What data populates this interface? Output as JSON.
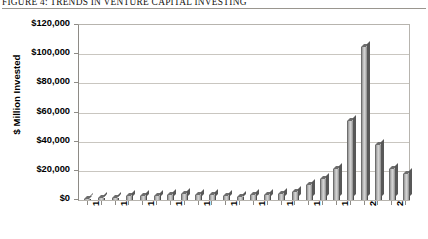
{
  "figure": {
    "title": "FIGURE 4: TRENDS IN VENTURE CAPITAL INVESTING"
  },
  "chart_data": {
    "type": "bar",
    "title": "FIGURE 4: TRENDS IN VENTURE CAPITAL INVESTING",
    "xlabel": "",
    "ylabel": "$ Million Invested",
    "ylim": [
      0,
      120000
    ],
    "ytick_labels": [
      "$120,000",
      "$100,000",
      "$80,000",
      "$60,000",
      "$40,000",
      "$20,000",
      "$0"
    ],
    "ytick_values": [
      120000,
      100000,
      80000,
      60000,
      40000,
      20000,
      0
    ],
    "grid": true,
    "legend": false,
    "xtick_labels": [
      "1980",
      "1982",
      "1984",
      "1986",
      "1988",
      "1990",
      "1992",
      "1994",
      "1996",
      "1998",
      "2000",
      "2002"
    ],
    "xtick_label_rotation": 90,
    "categories": [
      "1980",
      "1981",
      "1982",
      "1983",
      "1984",
      "1985",
      "1986",
      "1987",
      "1988",
      "1989",
      "1990",
      "1991",
      "1992",
      "1993",
      "1994",
      "1995",
      "1996",
      "1997",
      "1998",
      "1999",
      "2000",
      "2001",
      "2002",
      "2003"
    ],
    "values": [
      600,
      1100,
      1400,
      2800,
      2900,
      2700,
      3200,
      3800,
      3400,
      3300,
      2800,
      1900,
      3400,
      3700,
      3900,
      5600,
      10000,
      14300,
      21000,
      54000,
      105000,
      38000,
      21000,
      18000
    ],
    "bar_color": "#b0b0b0",
    "series": [
      {
        "name": "Venture Capital Invested",
        "values": [
          600,
          1100,
          1400,
          2800,
          2900,
          2700,
          3200,
          3800,
          3400,
          3300,
          2800,
          1900,
          3400,
          3700,
          3900,
          5600,
          10000,
          14300,
          21000,
          54000,
          105000,
          38000,
          21000,
          18000
        ]
      }
    ]
  }
}
